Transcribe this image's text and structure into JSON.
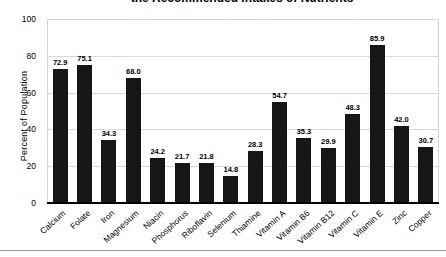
{
  "chart_data": {
    "type": "bar",
    "title": "the Recommended Intakes of Nutrients",
    "title_partially_cut_off": true,
    "ylabel": "Percent of Population",
    "xlabel": "",
    "ylim": [
      0,
      100
    ],
    "yticks": [
      0,
      20,
      40,
      60,
      80,
      100
    ],
    "grid": "horizontal",
    "legend": "none",
    "data_labels_shown": true,
    "categories": [
      "Calcium",
      "Folate",
      "Iron",
      "Magnesium",
      "Niacin",
      "Phosphorus",
      "Riboflavin",
      "Selenium",
      "Thiamine",
      "Vitamin A",
      "Vitamin B6",
      "Vitamin B12",
      "Vitamin C",
      "Vitamin E",
      "Zinc",
      "Copper"
    ],
    "values": [
      72.9,
      75.1,
      34.3,
      68.0,
      24.2,
      21.7,
      21.8,
      14.8,
      28.3,
      54.7,
      35.3,
      29.9,
      48.3,
      85.9,
      42.0,
      30.7
    ],
    "colors": {
      "bar": "#161616",
      "gridline": "#d9d9d9",
      "axis_line": "#000000",
      "plot_border": "#d6d6d6",
      "text": "#000000",
      "background": "#ffffff"
    }
  }
}
